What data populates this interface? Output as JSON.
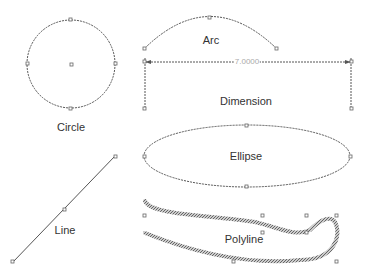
{
  "shapes": {
    "circle": {
      "label": "Circle"
    },
    "arc": {
      "label": "Arc"
    },
    "dimension": {
      "label": "Dimension",
      "value": "7.0000"
    },
    "ellipse": {
      "label": "Ellipse"
    },
    "line": {
      "label": "Line"
    },
    "polyline": {
      "label": "Polyline"
    }
  },
  "colors": {
    "stroke": "#555555",
    "handle": "#666666",
    "polyline": "#888888"
  }
}
